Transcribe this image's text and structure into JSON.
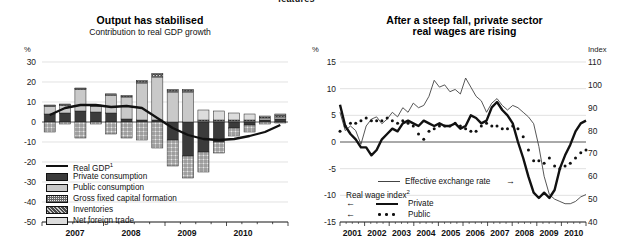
{
  "page": {
    "clipped_header_fragment": "features"
  },
  "left_chart": {
    "title": "Output has stabilised",
    "subtitle": "Contribution to real GDP growth",
    "y_unit": "%",
    "y_ticks": [
      "30",
      "20",
      "10",
      "0",
      "-10",
      "-20",
      "-30",
      "-40",
      "-50"
    ],
    "x_ticks": [
      "2007",
      "2008",
      "2009",
      "2010"
    ],
    "legend": [
      {
        "label": "Real GDP",
        "sup": "1",
        "swatch": "line"
      },
      {
        "label": "Private consumption",
        "sup": "",
        "swatch": "dark"
      },
      {
        "label": "Public consumption",
        "sup": "",
        "swatch": "light"
      },
      {
        "label": "Gross fixed capital formation",
        "sup": "",
        "swatch": "grid"
      },
      {
        "label": "Inventories",
        "sup": "",
        "swatch": "speckle"
      },
      {
        "label": "Net foreign trade",
        "sup": "",
        "swatch": "pale"
      }
    ]
  },
  "right_chart": {
    "title_line1": "After a steep fall, private sector",
    "title_line2": "real wages are rising",
    "y_unit_left": "%",
    "y_unit_right": "Index",
    "y_ticks_left": [
      "15",
      "10",
      "5",
      "0",
      "-5",
      "-10",
      "-15"
    ],
    "y_ticks_right": [
      "110",
      "100",
      "90",
      "80",
      "70",
      "60",
      "50",
      "40"
    ],
    "x_ticks": [
      "2001",
      "2002",
      "2003",
      "2004",
      "2005",
      "2006",
      "2007",
      "2008",
      "2009",
      "2010"
    ],
    "legend": {
      "eer": {
        "label": "Effective exchange rate",
        "arrow": "→"
      },
      "group": {
        "label": "Real wage index",
        "sup": "2"
      },
      "private": {
        "label": "Private",
        "arrow": "←"
      },
      "public": {
        "label": "Public",
        "arrow": "←"
      }
    }
  },
  "chart_data": [
    {
      "type": "bar",
      "chart": "left",
      "title": "Output has stabilised",
      "subtitle": "Contribution to real GDP growth",
      "xlabel": "",
      "ylabel": "%",
      "ylim": [
        -50,
        30
      ],
      "grid": true,
      "legend_position": "inside-bottom-left",
      "stacked": true,
      "categories": [
        "2007Q1",
        "2007Q2",
        "2007Q3",
        "2007Q4",
        "2008Q1",
        "2008Q2",
        "2008Q3",
        "2008Q4",
        "2009Q1",
        "2009Q2",
        "2009Q3",
        "2009Q4",
        "2010Q1",
        "2010Q2",
        "2010Q3",
        "2010Q4"
      ],
      "series": [
        {
          "name": "Private consumption",
          "values": [
            4.0,
            4.5,
            5.5,
            5.0,
            4.5,
            1.5,
            1.0,
            1.0,
            -9.0,
            -17.0,
            -15.0,
            -10.0,
            -3.0,
            -1.5,
            1.0,
            1.5
          ]
        },
        {
          "name": "Public consumption",
          "values": [
            4.0,
            4.0,
            11.0,
            3.0,
            9.0,
            11.0,
            18.5,
            21.5,
            15.0,
            15.0,
            0.5,
            0.5,
            0.5,
            0.5,
            1.0,
            1.0
          ]
        },
        {
          "name": "Gross fixed capital formation",
          "values": [
            -5.0,
            -1.0,
            -8.0,
            -1.0,
            -6.0,
            -8.0,
            -9.0,
            -13.0,
            -13.0,
            -11.0,
            -10.0,
            -5.5,
            -4.0,
            -3.5,
            -1.0,
            -0.5
          ]
        },
        {
          "name": "Inventories",
          "values": [
            0.2,
            0.2,
            0.2,
            0.2,
            0.3,
            0.5,
            1.0,
            1.5,
            1.0,
            1.0,
            0.5,
            0.5,
            0.5,
            0.5,
            0.5,
            1.0
          ]
        },
        {
          "name": "Net foreign trade",
          "values": [
            0.3,
            0.3,
            0.3,
            0.3,
            0.3,
            0.3,
            0.3,
            0.3,
            0.3,
            0.3,
            5.0,
            4.5,
            3.5,
            3.0,
            0.5,
            0.5
          ]
        }
      ],
      "line_series": {
        "name": "Real GDP",
        "values": [
          3.5,
          7.0,
          8.5,
          8.5,
          7.5,
          8.0,
          7.0,
          2.0,
          -3.0,
          -6.5,
          -8.5,
          -9.0,
          -8.5,
          -7.0,
          -5.0,
          -1.5
        ]
      }
    },
    {
      "type": "line",
      "chart": "right",
      "title": "After a steep fall, private sector real wages are rising",
      "xlabel": "",
      "ylabel": "%",
      "y2label": "Index",
      "ylim": [
        -15,
        15
      ],
      "y2lim": [
        40,
        110
      ],
      "grid": true,
      "legend_position": "inside-bottom-left",
      "x": [
        "2001",
        "2002",
        "2003",
        "2004",
        "2005",
        "2006",
        "2007",
        "2008",
        "2009",
        "2010"
      ],
      "series": [
        {
          "name": "Effective exchange rate",
          "axis": "right",
          "style": "thin-solid",
          "values": [
            88,
            80,
            82,
            80,
            74,
            82,
            85,
            86,
            83,
            85,
            88,
            86,
            90,
            88,
            92,
            90,
            91,
            95,
            102,
            99,
            100,
            97,
            98,
            96,
            103,
            99,
            95,
            93,
            88,
            92,
            94,
            91,
            89,
            91,
            90,
            88,
            86,
            83,
            73,
            60,
            52,
            50,
            49,
            48,
            48,
            49,
            51,
            52
          ]
        },
        {
          "name": "Private",
          "axis": "left",
          "style": "thick-solid",
          "values": [
            7.0,
            3.0,
            1.5,
            0.5,
            -1.0,
            -1.0,
            -2.5,
            -1.5,
            0.5,
            1.5,
            2.5,
            2.0,
            3.5,
            4.0,
            3.5,
            3.0,
            4.0,
            3.5,
            3.0,
            3.5,
            3.0,
            3.0,
            3.5,
            2.5,
            3.0,
            5.0,
            4.5,
            3.5,
            4.0,
            6.5,
            7.5,
            6.0,
            5.0,
            3.5,
            0.0,
            -3.0,
            -6.5,
            -9.5,
            -10.5,
            -9.5,
            -10.5,
            -9.0,
            -5.0,
            -2.5,
            -0.5,
            2.0,
            3.5,
            4.0
          ]
        },
        {
          "name": "Public",
          "axis": "left",
          "style": "dotted",
          "values": [
            2.0,
            3.0,
            3.5,
            3.5,
            4.0,
            4.5,
            4.0,
            4.0,
            4.0,
            4.5,
            4.0,
            3.5,
            4.0,
            3.5,
            3.0,
            1.5,
            0.5,
            2.0,
            2.5,
            3.0,
            3.0,
            3.0,
            3.5,
            3.0,
            2.5,
            2.0,
            2.0,
            3.0,
            3.5,
            3.0,
            3.0,
            2.5,
            2.5,
            3.0,
            2.5,
            1.0,
            -1.5,
            -3.5,
            -3.5,
            -4.0,
            -3.0,
            -4.5,
            -5.0,
            -4.5,
            -4.0,
            -3.0,
            -2.0,
            -1.5
          ]
        }
      ]
    }
  ]
}
